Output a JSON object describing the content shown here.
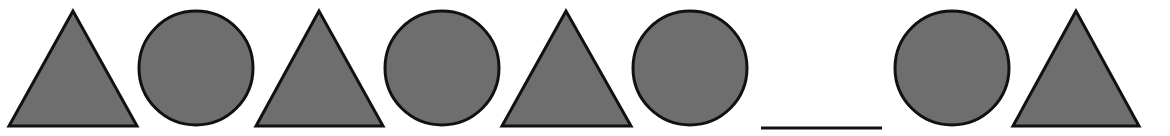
{
  "colors": {
    "fill": "#6e6e6e",
    "stroke": "#111111",
    "background": "#ffffff"
  },
  "sequence": [
    {
      "shape": "triangle",
      "label": "triangle"
    },
    {
      "shape": "circle",
      "label": "circle"
    },
    {
      "shape": "triangle",
      "label": "triangle"
    },
    {
      "shape": "circle",
      "label": "circle"
    },
    {
      "shape": "triangle",
      "label": "triangle"
    },
    {
      "shape": "circle",
      "label": "circle"
    },
    {
      "shape": "blank",
      "label": "missing shape (answer blank)"
    },
    {
      "shape": "circle",
      "label": "circle"
    },
    {
      "shape": "triangle",
      "label": "triangle"
    }
  ]
}
